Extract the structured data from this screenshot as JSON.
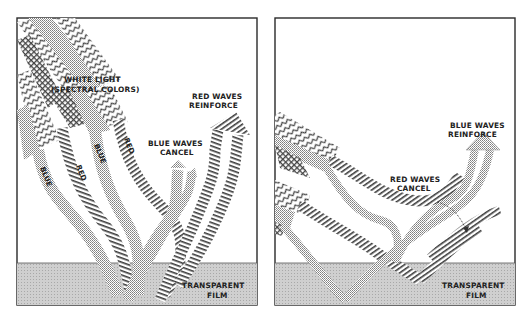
{
  "figure": {
    "colors": {
      "frame": "#2a2a2a",
      "film_fill": "#c9c9c9",
      "ray_stipple": "#8a8a8a",
      "ray_hatch": "#3a3a3a",
      "background": "#ffffff"
    }
  },
  "left_panel": {
    "incoming_label_line1": "WHITE LIGHT",
    "incoming_label_line2": "(SPECTRAL COLORS)",
    "reinforce_label_line1": "RED WAVES",
    "reinforce_label_line2": "REINFORCE",
    "cancel_label_line1": "BLUE WAVES",
    "cancel_label_line2": "CANCEL",
    "ray_labels": [
      "BLUE",
      "RED",
      "BLUE",
      "RED"
    ],
    "film_label_line1": "TRANSPARENT",
    "film_label_line2": "FILM"
  },
  "right_panel": {
    "reinforce_label_line1": "BLUE WAVES",
    "reinforce_label_line2": "REINFORCE",
    "cancel_label_line1": "RED WAVES",
    "cancel_label_line2": "CANCEL",
    "film_label_line1": "TRANSPARENT",
    "film_label_line2": "FILM"
  }
}
